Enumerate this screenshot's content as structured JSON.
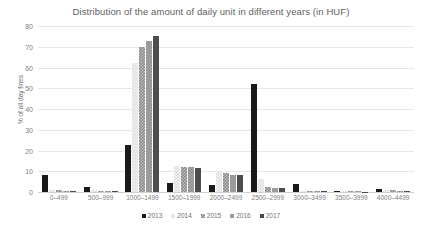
{
  "chart_data": {
    "type": "bar",
    "title": "Distribution of the amount of daily unit in different years (in HUF)",
    "xlabel": "",
    "ylabel": "% of all day fines",
    "ylim": [
      0,
      80
    ],
    "ytick_step": 10,
    "yticks": [
      0,
      10,
      20,
      30,
      40,
      50,
      60,
      70,
      80
    ],
    "grid": true,
    "legend_position": "bottom",
    "categories": [
      "0–499",
      "500–999",
      "1000–1499",
      "1500–1999",
      "2000–2499",
      "2500–2999",
      "3000–3499",
      "3500–3999",
      "4000–4499"
    ],
    "series": [
      {
        "name": "2013",
        "color": "#1a1a1a",
        "values": [
          8.0,
          2.5,
          22.5,
          4.5,
          3.2,
          52.0,
          3.8,
          0.4,
          1.6
        ]
      },
      {
        "name": "2014",
        "color": "#f2f2f2",
        "values": [
          1.0,
          0.8,
          62.0,
          12.5,
          9.8,
          6.5,
          0.6,
          0.3,
          0.9
        ]
      },
      {
        "name": "2015",
        "color": "#8c8c8c",
        "values": [
          0.9,
          0.5,
          70.0,
          12.2,
          9.3,
          2.4,
          0.5,
          0.3,
          0.8
        ]
      },
      {
        "name": "2016",
        "color": "#a6a6a6",
        "values": [
          0.7,
          0.4,
          73.0,
          12.0,
          8.4,
          2.0,
          0.5,
          0.3,
          0.7
        ]
      },
      {
        "name": "2017",
        "color": "#4d4d4d",
        "values": [
          0.6,
          0.3,
          75.0,
          11.8,
          8.2,
          2.0,
          0.4,
          0.2,
          0.6
        ]
      }
    ]
  }
}
